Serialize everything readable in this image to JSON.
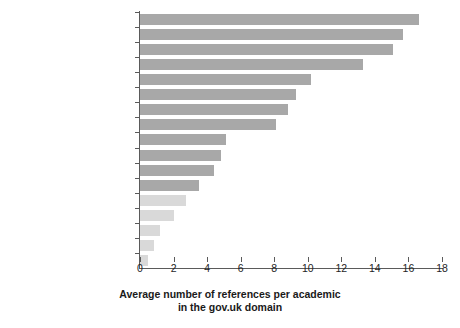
{
  "chart_data": {
    "type": "bar",
    "orientation": "horizontal",
    "title": "",
    "subtitle": "",
    "xlabel": "Average number of references per academic in the gov.uk domain",
    "xlabel_lines": [
      "Average number of references per academic",
      "in the gov.uk domain"
    ],
    "ylabel": "",
    "xlim": [
      0,
      18
    ],
    "xticks": [
      0,
      2,
      4,
      6,
      8,
      10,
      12,
      14,
      16,
      18
    ],
    "xtick_labels": [
      "0",
      "2",
      "4",
      "6",
      "8",
      "10",
      "12",
      "14",
      "16",
      "18"
    ],
    "grid": false,
    "legend": null,
    "categories": [
      "Social Policy",
      "Geography",
      "Economics",
      "Sociology",
      "Political Science",
      "Anthropology",
      "Comm & Media Studies",
      "History",
      "Psychology",
      "Law",
      "Business & Management",
      "Philosophy",
      "Medicine",
      "Engineering",
      "Chemistry",
      "Physics",
      "Computer Science"
    ],
    "values": [
      16.6,
      15.7,
      15.1,
      13.3,
      10.2,
      9.3,
      8.8,
      8.1,
      5.1,
      4.8,
      4.4,
      3.5,
      2.75,
      2.0,
      1.2,
      0.85,
      0.45
    ],
    "bars": [
      {
        "label": "Social Policy",
        "value": 16.6,
        "group": "social-sciences"
      },
      {
        "label": "Geography",
        "value": 15.7,
        "group": "social-sciences"
      },
      {
        "label": "Economics",
        "value": 15.1,
        "group": "social-sciences"
      },
      {
        "label": "Sociology",
        "value": 13.3,
        "group": "social-sciences"
      },
      {
        "label": "Political Science",
        "value": 10.2,
        "group": "social-sciences"
      },
      {
        "label": "Anthropology",
        "value": 9.3,
        "group": "social-sciences"
      },
      {
        "label": "Comm & Media Studies",
        "value": 8.8,
        "group": "social-sciences"
      },
      {
        "label": "History",
        "value": 8.1,
        "group": "social-sciences"
      },
      {
        "label": "Psychology",
        "value": 5.1,
        "group": "social-sciences"
      },
      {
        "label": "Law",
        "value": 4.8,
        "group": "social-sciences"
      },
      {
        "label": "Business & Management",
        "value": 4.4,
        "group": "social-sciences"
      },
      {
        "label": "Philosophy",
        "value": 3.5,
        "group": "social-sciences"
      },
      {
        "label": "Medicine",
        "value": 2.75,
        "group": "stem"
      },
      {
        "label": "Engineering",
        "value": 2.0,
        "group": "stem"
      },
      {
        "label": "Chemistry",
        "value": 1.2,
        "group": "stem"
      },
      {
        "label": "Physics",
        "value": 0.85,
        "group": "stem"
      },
      {
        "label": "Computer Science",
        "value": 0.45,
        "group": "stem"
      }
    ],
    "colors": {
      "bar_primary": "#a8a8a8",
      "bar_muted": "#d9d9d9",
      "label_primary": "#2b2b2b",
      "label_muted": "#9b9b9b",
      "axis": "#5a5a5a",
      "background": "#ffffff"
    }
  }
}
